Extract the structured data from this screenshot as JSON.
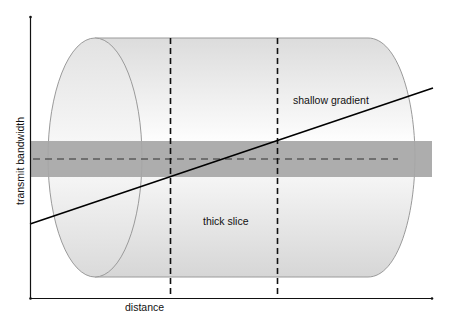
{
  "diagram": {
    "axes": {
      "x_label": "distance",
      "y_label": "transmit bandwidth"
    },
    "annotations": {
      "gradient_label": "shallow gradient",
      "slice_label": "thick slice"
    },
    "colors": {
      "cylinder_outline": "#9a9a9a",
      "cylinder_fill_light": "#ffffff",
      "cylinder_fill_dark": "#d9d9d9",
      "band_fill": "#a6a6a6",
      "line": "#000000",
      "dashed": "#333333"
    }
  }
}
